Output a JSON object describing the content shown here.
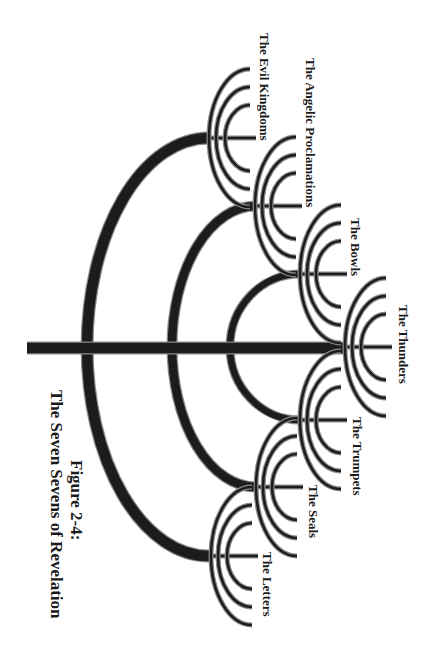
{
  "figure": {
    "caption_number": "Figure 2-4:",
    "caption_title": "The Seven Sevens of Revelation"
  },
  "colors": {
    "stroke_dark": "#1c1c1c",
    "stroke_outline": "#8a8a8a",
    "background": "#ffffff",
    "text": "#1a1a1a"
  },
  "diagram": {
    "type": "menorah-tree",
    "main_stem": {
      "x1": 27,
      "x2": 345,
      "y": 348
    },
    "fans": [
      {
        "id": "evil-kingdoms",
        "label": "The Evil Kingdoms",
        "cx": 250,
        "cy": 138,
        "label_x": 272,
        "label_y": 33
      },
      {
        "id": "angelic-proclamations",
        "label": "The Angelic Proclamations",
        "cx": 296,
        "cy": 206,
        "label_x": 318,
        "label_y": 58
      },
      {
        "id": "bowls",
        "label": "The Bowls",
        "cx": 341,
        "cy": 274,
        "label_x": 363,
        "label_y": 218
      },
      {
        "id": "thunders",
        "label": "The Thunders",
        "cx": 386,
        "cy": 347,
        "label_x": 411,
        "label_y": 305
      },
      {
        "id": "trumpets",
        "label": "The Trumpets",
        "cx": 341,
        "cy": 420,
        "label_x": 365,
        "label_y": 417
      },
      {
        "id": "seals",
        "label": "The Seals",
        "cx": 297,
        "cy": 487,
        "label_x": 321,
        "label_y": 485
      },
      {
        "id": "letters",
        "label": "The Letters",
        "cx": 252,
        "cy": 556,
        "label_x": 275,
        "label_y": 552
      }
    ],
    "fan_arcs": [
      {
        "rx": 41,
        "ry": 69
      },
      {
        "rx": 34,
        "ry": 51
      },
      {
        "rx": 25,
        "ry": 33
      }
    ],
    "branch_arcs": [
      {
        "connects": [
          "evil-kingdoms",
          "letters"
        ],
        "top_y": 138,
        "bottom_y": 556,
        "left_x": 87,
        "right_x": 209
      },
      {
        "connects": [
          "angelic-proclamations",
          "seals"
        ],
        "top_y": 206,
        "bottom_y": 487,
        "left_x": 172,
        "right_x": 256
      },
      {
        "connects": [
          "bowls",
          "trumpets"
        ],
        "top_y": 274,
        "bottom_y": 420,
        "left_x": 230,
        "right_x": 300
      }
    ]
  }
}
